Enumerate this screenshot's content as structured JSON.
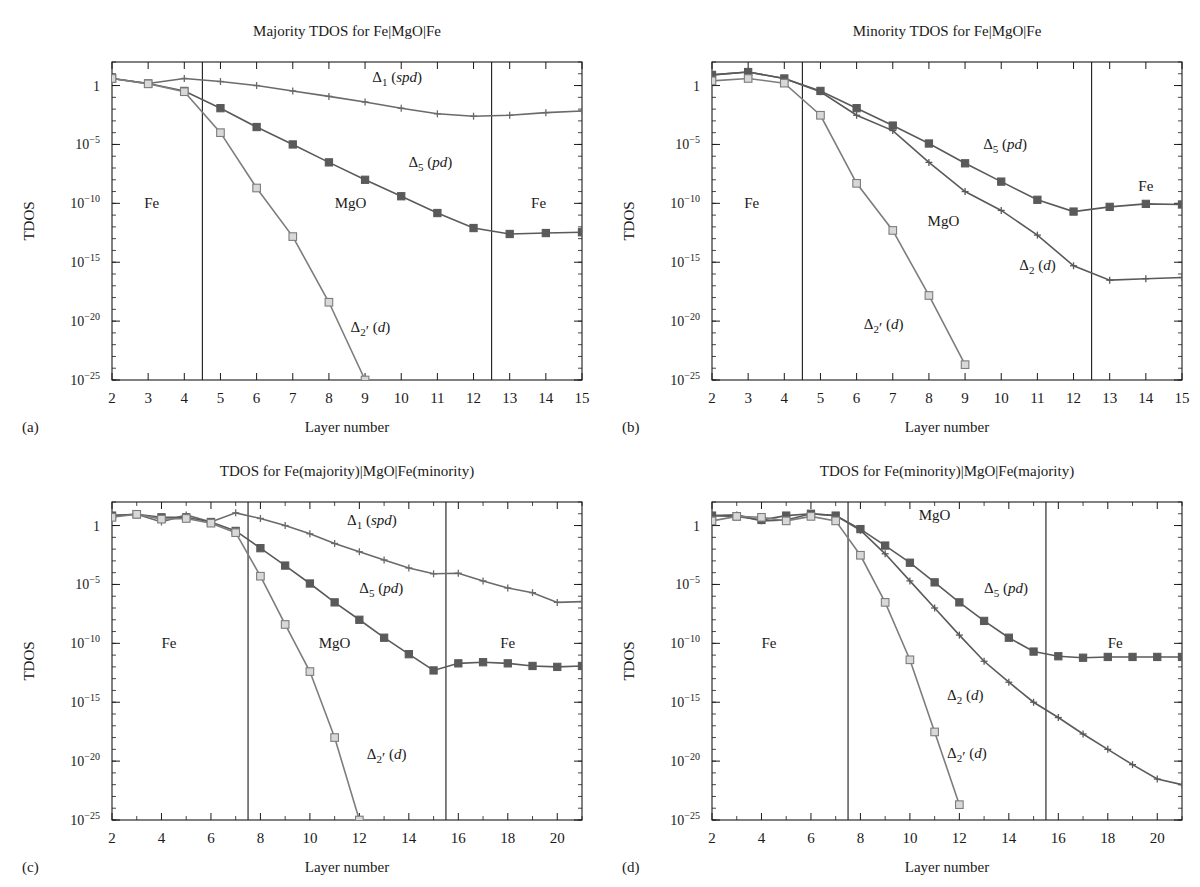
{
  "figure": {
    "ylabel": "TDOS",
    "xlabel": "Layer number",
    "region_labels": {
      "left": "Fe",
      "middle": "MgO",
      "right": "Fe"
    },
    "series_colors": {
      "delta1": "#6a6a6a",
      "delta5": "#5a5a5a",
      "delta2": "#5a5a5a",
      "delta2p": "#7d7d7d"
    },
    "y_tick_labels": [
      "1",
      "10",
      "10",
      "10",
      "10",
      "10"
    ],
    "y_tick_exponents": [
      "",
      "−5",
      "−10",
      "−15",
      "−20",
      "−25"
    ]
  },
  "panels": [
    {
      "id": "(a)",
      "title": "Majority TDOS for Fe|MgO|Fe",
      "region_label_positions": {
        "left": 3.1,
        "middle": 8.6,
        "right": 13.8
      }
    },
    {
      "id": "(b)",
      "title": "Minority TDOS for Fe|MgO|Fe",
      "region_label_positions": {
        "left": 3.1,
        "middle": 8.4,
        "right": 14.0
      }
    },
    {
      "id": "(c)",
      "title": "TDOS for Fe(majority)|MgO|Fe(minority)",
      "region_label_positions": {
        "left": 4.3,
        "middle": 11.0,
        "right": 18.0
      }
    },
    {
      "id": "(d)",
      "title": "TDOS for Fe(minority)|MgO|Fe(majority)",
      "region_label_positions": {
        "left": 4.3,
        "middle": 11.0,
        "right": 18.3
      }
    }
  ],
  "chart_data": [
    {
      "panel": "(a)",
      "type": "line",
      "title": "Majority TDOS for Fe|MgO|Fe",
      "xlabel": "Layer number",
      "ylabel": "TDOS",
      "xlim": [
        2,
        15
      ],
      "ylim": [
        1e-25,
        100
      ],
      "yscale": "log",
      "xticks": [
        2,
        3,
        4,
        5,
        6,
        7,
        8,
        9,
        10,
        11,
        12,
        13,
        14,
        15
      ],
      "yticks": [
        1,
        1e-05,
        1e-10,
        1e-15,
        1e-20,
        1e-25
      ],
      "interfaces": [
        4.5,
        12.5
      ],
      "grid": false,
      "series": [
        {
          "name": "Δ1(spd)",
          "label": "Δ₁(spd)",
          "marker": "plus",
          "x": [
            2,
            3,
            4,
            5,
            6,
            7,
            8,
            9,
            10,
            11,
            12,
            13,
            14,
            15
          ],
          "values": [
            4.0,
            1.5,
            4.0,
            2.2,
            1.0,
            0.35,
            0.12,
            0.04,
            0.012,
            0.004,
            0.0025,
            0.003,
            0.005,
            0.007
          ],
          "label_x": 9.2,
          "label_y": 2.0
        },
        {
          "name": "Δ5(pd)",
          "label": "Δ₅ (pd)",
          "marker": "square",
          "x": [
            2,
            3,
            4,
            5,
            6,
            7,
            8,
            9,
            10,
            11,
            12,
            13,
            14,
            15
          ],
          "values": [
            4.0,
            1.5,
            0.35,
            0.012,
            0.0003,
            1e-05,
            3e-07,
            1e-08,
            4e-10,
            1.5e-11,
            8e-13,
            2.5e-13,
            3e-13,
            3.5e-13
          ],
          "label_x": 10.2,
          "label_y": 1.2e-07
        },
        {
          "name": "Δ2'(d)",
          "label": "Δ₂·(d)",
          "marker": "opensquare",
          "x": [
            2,
            3,
            4,
            5,
            6,
            7,
            8,
            9
          ],
          "values": [
            4.0,
            1.4,
            0.3,
            0.0001,
            2e-09,
            1.5e-13,
            4e-19,
            1e-25
          ],
          "label_x": 8.6,
          "label_y": 1.2e-21
        }
      ]
    },
    {
      "panel": "(b)",
      "type": "line",
      "title": "Minority TDOS for Fe|MgO|Fe",
      "xlabel": "Layer number",
      "ylabel": "TDOS",
      "xlim": [
        2,
        15
      ],
      "ylim": [
        1e-25,
        100
      ],
      "yscale": "log",
      "xticks": [
        2,
        3,
        4,
        5,
        6,
        7,
        8,
        9,
        10,
        11,
        12,
        13,
        14,
        15
      ],
      "yticks": [
        1,
        1e-05,
        1e-10,
        1e-15,
        1e-20,
        1e-25
      ],
      "interfaces": [
        4.5,
        12.5
      ],
      "grid": false,
      "series": [
        {
          "name": "Δ5(pd)",
          "label": "Δ₅ (pd)",
          "marker": "square",
          "x": [
            2,
            3,
            4,
            5,
            6,
            7,
            8,
            9,
            10,
            11,
            12,
            13,
            14,
            15
          ],
          "values": [
            8.0,
            14.0,
            4.0,
            0.35,
            0.012,
            0.0004,
            1.2e-05,
            2.5e-07,
            7e-09,
            2e-10,
            2e-11,
            5e-11,
            9e-11,
            8e-11
          ],
          "label_x": 9.5,
          "label_y": 4e-06
        },
        {
          "name": "Δ2(d)",
          "label": "Δ₂(d)",
          "marker": "plus",
          "x": [
            2,
            3,
            4,
            5,
            6,
            7,
            8,
            9,
            10,
            11,
            12,
            13,
            14,
            15
          ],
          "values": [
            8.0,
            14.0,
            4.0,
            0.3,
            0.003,
            0.00015,
            3e-07,
            1e-09,
            2.5e-11,
            2e-13,
            5e-16,
            3e-17,
            4e-17,
            5e-17
          ],
          "label_x": 10.5,
          "label_y": 2e-16
        },
        {
          "name": "Δ2'(d)",
          "label": "Δ₂·(d)",
          "marker": "opensquare",
          "x": [
            2,
            3,
            4,
            5,
            6,
            7,
            8,
            9
          ],
          "values": [
            2.5,
            4.0,
            1.6,
            0.003,
            5e-09,
            5e-13,
            1.5e-18,
            2e-24
          ],
          "label_x": 6.2,
          "label_y": 2e-21
        }
      ]
    },
    {
      "panel": "(c)",
      "type": "line",
      "title": "TDOS for Fe(majority)|MgO|Fe(minority)",
      "xlabel": "Layer number",
      "ylabel": "TDOS",
      "xlim": [
        2,
        21
      ],
      "ylim": [
        1e-25,
        100
      ],
      "yscale": "log",
      "xticks": [
        2,
        4,
        6,
        8,
        10,
        12,
        14,
        16,
        18,
        20
      ],
      "yticks": [
        1,
        1e-05,
        1e-10,
        1e-15,
        1e-20,
        1e-25
      ],
      "interfaces": [
        7.5,
        15.5
      ],
      "grid": false,
      "series": [
        {
          "name": "Δ1(spd)",
          "label": "Δ₁ (spd)",
          "marker": "plus",
          "x": [
            2,
            3,
            4,
            5,
            6,
            7,
            8,
            9,
            10,
            11,
            12,
            13,
            14,
            15,
            16,
            17,
            18,
            19,
            20,
            21
          ],
          "values": [
            7.0,
            9.0,
            2.0,
            8.0,
            2.0,
            12.0,
            4.0,
            1.0,
            0.2,
            0.03,
            0.006,
            0.0012,
            0.00025,
            8e-05,
            9e-05,
            2e-05,
            5e-06,
            2e-06,
            3e-07,
            3.5e-07
          ],
          "label_x": 11.5,
          "label_y": 1.2
        },
        {
          "name": "Δ5(pd)",
          "label": "Δ₅ (pd)",
          "marker": "square",
          "x": [
            2,
            3,
            4,
            5,
            6,
            7,
            8,
            9,
            10,
            11,
            12,
            13,
            14,
            15,
            16,
            17,
            18,
            19,
            20,
            21
          ],
          "values": [
            7.0,
            9.0,
            5.0,
            5.0,
            2.0,
            0.35,
            0.012,
            0.0004,
            1.2e-05,
            3e-07,
            1e-08,
            3e-10,
            1.2e-11,
            5e-13,
            2e-12,
            2.5e-12,
            2e-12,
            1.2e-12,
            1e-12,
            1.2e-12
          ],
          "label_x": 12.0,
          "label_y": 2e-06
        },
        {
          "name": "Δ2'(d)",
          "label": "Δ₂· (d)",
          "marker": "opensquare",
          "x": [
            2,
            3,
            4,
            5,
            6,
            7,
            8,
            9,
            10,
            11,
            12
          ],
          "values": [
            5.0,
            9.0,
            3.5,
            4.0,
            1.6,
            0.25,
            5e-05,
            4e-09,
            4e-13,
            1e-18,
            1e-25
          ],
          "label_x": 12.3,
          "label_y": 1.5e-20
        }
      ]
    },
    {
      "panel": "(d)",
      "type": "line",
      "title": "TDOS for Fe(minority)|MgO|Fe(majority)",
      "xlabel": "Layer number",
      "ylabel": "TDOS",
      "xlim": [
        2,
        21
      ],
      "ylim": [
        1e-25,
        100
      ],
      "yscale": "log",
      "xticks": [
        2,
        4,
        6,
        8,
        10,
        12,
        14,
        16,
        18,
        20
      ],
      "yticks": [
        1,
        1e-05,
        1e-10,
        1e-15,
        1e-20,
        1e-25
      ],
      "interfaces": [
        7.5,
        15.5
      ],
      "grid": false,
      "series": [
        {
          "name": "Δ5(pd)",
          "label": "Δ₅ (pd)",
          "marker": "square",
          "x": [
            2,
            3,
            4,
            5,
            6,
            7,
            8,
            9,
            10,
            11,
            12,
            13,
            14,
            15,
            16,
            17,
            18,
            19,
            20,
            21
          ],
          "values": [
            7.0,
            6.0,
            3.0,
            7.0,
            10.0,
            7.0,
            0.5,
            0.02,
            0.0007,
            1.5e-05,
            3e-07,
            8e-09,
            3e-10,
            2e-11,
            8e-12,
            6e-12,
            7e-12,
            7e-12,
            7e-12,
            7e-12
          ],
          "label_x": 13.0,
          "label_y": 2e-06
        },
        {
          "name": "Δ2(d)",
          "label": "Δ₂ (d)",
          "marker": "plus",
          "x": [
            2,
            3,
            4,
            5,
            6,
            7,
            8,
            9,
            10,
            11,
            12,
            13,
            14,
            15,
            16,
            17,
            18,
            19,
            20,
            21
          ],
          "values": [
            7.0,
            8.0,
            2.5,
            3.0,
            10.0,
            7.0,
            0.4,
            0.004,
            2e-05,
            1e-07,
            5e-10,
            3e-12,
            5e-14,
            1e-15,
            5e-17,
            2e-18,
            1e-19,
            5e-21,
            3e-22,
            1e-22
          ],
          "label_x": 11.5,
          "label_y": 1.5e-15
        },
        {
          "name": "Δ2'(d)",
          "label": "Δ₂· (d)",
          "marker": "opensquare",
          "x": [
            2,
            3,
            4,
            5,
            6,
            7,
            8,
            9,
            10,
            11,
            12
          ],
          "values": [
            2.5,
            6.0,
            5.0,
            2.5,
            6.0,
            2.5,
            0.003,
            3e-07,
            4e-12,
            3e-18,
            2e-24
          ],
          "label_x": 11.5,
          "label_y": 2e-20
        }
      ]
    }
  ]
}
